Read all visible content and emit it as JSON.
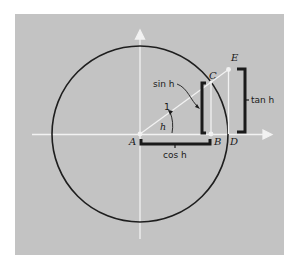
{
  "diagram": {
    "colors": {
      "background": "#ffffff",
      "panel": "#c3c3c3",
      "circle": "#1e1e1e",
      "axes": "#f2f2f2",
      "bracket": "#1a1a1a",
      "text": "#1a1a1a"
    },
    "points": {
      "A": "A",
      "B": "B",
      "C": "C",
      "D": "D",
      "E": "E"
    },
    "labels": {
      "radius": "1",
      "angle": "h",
      "sin": "sin h",
      "cos": "cos h",
      "tan": "tan h"
    }
  }
}
